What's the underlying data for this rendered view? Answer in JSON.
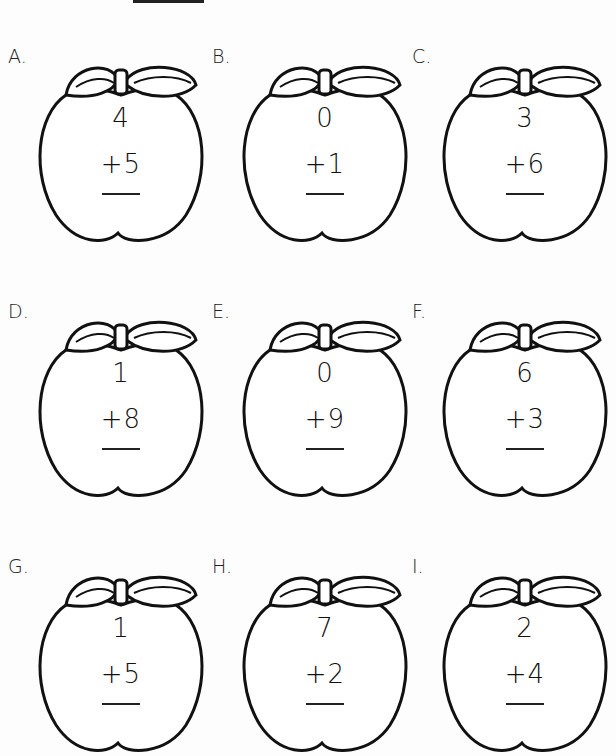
{
  "worksheet": {
    "name_line": "",
    "problems": [
      {
        "label": "A.",
        "top": "4",
        "bottom": "+5"
      },
      {
        "label": "B.",
        "top": "0",
        "bottom": "+1"
      },
      {
        "label": "C.",
        "top": "3",
        "bottom": "+6"
      },
      {
        "label": "D.",
        "top": "1",
        "bottom": "+8"
      },
      {
        "label": "E.",
        "top": "0",
        "bottom": "+9"
      },
      {
        "label": "F.",
        "top": "6",
        "bottom": "+3"
      },
      {
        "label": "G.",
        "top": "1",
        "bottom": "+5"
      },
      {
        "label": "H.",
        "top": "7",
        "bottom": "+2"
      },
      {
        "label": "I.",
        "top": "2",
        "bottom": "+4"
      }
    ]
  }
}
